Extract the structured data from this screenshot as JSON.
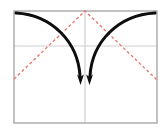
{
  "figure": {
    "title": "",
    "background_color": "#ffffff",
    "width": 165,
    "height": 140
  },
  "frame": {
    "name": "plot-frame",
    "color": "#a8a8a8",
    "stroke_width": 1.4,
    "x": 14,
    "y": 11,
    "width": 143,
    "height": 112
  },
  "gridlines": {
    "color": "#cfcfcf",
    "stroke_width": 1.2,
    "horizontal": {
      "label": "horizontal-midline",
      "y": 46,
      "x1": 14,
      "x2": 157
    },
    "vertical": {
      "label": "vertical-midline",
      "x": 85,
      "y1": 11,
      "y2": 123
    }
  },
  "dashed_path": {
    "name": "dashed-triangle-path",
    "color": "#e8736e",
    "stroke_width": 1.3,
    "dash_pattern": "3 2.4",
    "points": [
      {
        "x": 14,
        "y": 79
      },
      {
        "x": 85,
        "y": 11
      },
      {
        "x": 157,
        "y": 80
      }
    ]
  },
  "curves": [
    {
      "name": "left-arrow-curve",
      "color": "#0d0d0d",
      "stroke_width": 3.0,
      "start": {
        "x": 16,
        "y": 13
      },
      "control1": {
        "x": 52,
        "y": 15
      },
      "control2": {
        "x": 78,
        "y": 42
      },
      "end": {
        "x": 80,
        "y": 76
      },
      "arrowhead": {
        "x": 80.5,
        "y": 85,
        "direction": "down"
      }
    },
    {
      "name": "right-arrow-curve",
      "color": "#0d0d0d",
      "stroke_width": 3.0,
      "start": {
        "x": 155,
        "y": 13
      },
      "control1": {
        "x": 118,
        "y": 15
      },
      "control2": {
        "x": 92,
        "y": 42
      },
      "end": {
        "x": 90,
        "y": 76
      },
      "arrowhead": {
        "x": 89.5,
        "y": 85,
        "direction": "down"
      }
    }
  ],
  "arrowheads": {
    "color": "#0d0d0d",
    "half_width": 3.4,
    "length": 10.5
  }
}
